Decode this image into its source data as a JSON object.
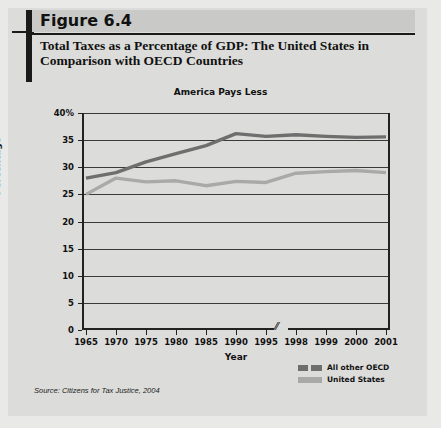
{
  "figure": {
    "number": "Figure 6.4",
    "title": "Total Taxes as a Percentage of GDP: The United States in Comparison with OECD Countries",
    "source": "Source: Citizens for Tax Justice, 2004"
  },
  "legend": {
    "items": [
      {
        "label": "All other OECD",
        "color": "#6e6e6e"
      },
      {
        "label": "United States",
        "color": "#a9a9a7"
      }
    ]
  },
  "chart_data": {
    "type": "line",
    "title": "America Pays Less",
    "xlabel": "Year",
    "ylabel": "Percentage",
    "categories": [
      "1965",
      "1970",
      "1975",
      "1980",
      "1985",
      "1990",
      "1995",
      "1998",
      "1999",
      "2000",
      "2001"
    ],
    "ylim": [
      0,
      40
    ],
    "yticks": [
      "0",
      "5",
      "10",
      "15",
      "20",
      "25",
      "30",
      "35",
      "40%"
    ],
    "ytick_values": [
      0,
      5,
      10,
      15,
      20,
      25,
      30,
      35,
      40
    ],
    "grid": true,
    "axis_break_after": "1995",
    "legend_position": "bottom-right",
    "series": [
      {
        "name": "All other OECD",
        "color": "#6e6e6e",
        "values": [
          28.0,
          29.0,
          31.0,
          32.5,
          34.0,
          36.2,
          35.7,
          36.0,
          35.7,
          35.5,
          35.6
        ]
      },
      {
        "name": "United States",
        "color": "#a9a9a7",
        "values": [
          25.0,
          28.0,
          27.3,
          27.5,
          26.6,
          27.4,
          27.2,
          28.9,
          29.2,
          29.4,
          29.0
        ]
      }
    ]
  }
}
